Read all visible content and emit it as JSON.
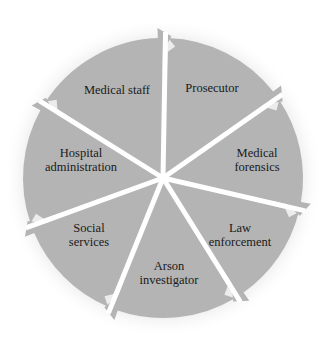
{
  "diagram": {
    "type": "cycle",
    "direction": "clockwise",
    "center": [
      163,
      178
    ],
    "radius": 140,
    "colors": {
      "sector": "#b4b4b4",
      "gap": "#ffffff",
      "halo": "#f2f2f2",
      "text": "#1a1a1a"
    },
    "sectors": [
      {
        "id": "prosecutor",
        "label": "Prosecutor",
        "pos": [
          212,
          88
        ]
      },
      {
        "id": "medical-forensics",
        "label": "Medical\nforensics",
        "pos": [
          257,
          160
        ]
      },
      {
        "id": "law-enforcement",
        "label": "Law\nenforcement",
        "pos": [
          240,
          235
        ]
      },
      {
        "id": "arson-investigator",
        "label": "Arson\ninvestigator",
        "pos": [
          169,
          273
        ]
      },
      {
        "id": "social-services",
        "label": "Social\nservices",
        "pos": [
          89,
          235
        ]
      },
      {
        "id": "hospital-administration",
        "label": "Hospital\nadministration",
        "pos": [
          81,
          160
        ]
      },
      {
        "id": "medical-staff",
        "label": "Medical staff",
        "pos": [
          117,
          90
        ]
      }
    ]
  }
}
